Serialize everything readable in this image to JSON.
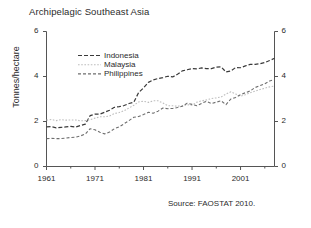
{
  "chart_data": {
    "type": "line",
    "title": "Archipelagic Southeast Asia",
    "xlabel": "",
    "ylabel": "Tonnes/hectare",
    "ylim": [
      0,
      6
    ],
    "xlim": [
      1961,
      2008
    ],
    "yticks": [
      "0",
      "2",
      "4",
      "6"
    ],
    "ytick_values": [
      0,
      2,
      4,
      6
    ],
    "xticks": [
      "1961",
      "1971",
      "1981",
      "1991",
      "2001"
    ],
    "xtick_values": [
      1961,
      1971,
      1981,
      1991,
      2001
    ],
    "minor_xtick_values": [
      1966,
      1976,
      1986,
      1996,
      2006
    ],
    "grid": false,
    "legend_position": "upper-left-inside",
    "dual_y_axis": true,
    "right_axis_ticks": [
      "0",
      "2",
      "4",
      "6"
    ],
    "source_note": "Source: FAOSTAT 2010.",
    "x": [
      1961,
      1962,
      1963,
      1964,
      1965,
      1966,
      1967,
      1968,
      1969,
      1970,
      1971,
      1972,
      1973,
      1974,
      1975,
      1976,
      1977,
      1978,
      1979,
      1980,
      1981,
      1982,
      1983,
      1984,
      1985,
      1986,
      1987,
      1988,
      1989,
      1990,
      1991,
      1992,
      1993,
      1994,
      1995,
      1996,
      1997,
      1998,
      1999,
      2000,
      2001,
      2002,
      2003,
      2004,
      2005,
      2006,
      2007,
      2008
    ],
    "series": [
      {
        "name": "Indonesia",
        "color": "#3a3a3a",
        "dash": "4,2",
        "width": 1.2,
        "values": [
          1.76,
          1.77,
          1.72,
          1.74,
          1.76,
          1.78,
          1.75,
          1.82,
          1.88,
          2.26,
          2.33,
          2.33,
          2.41,
          2.5,
          2.63,
          2.66,
          2.71,
          2.8,
          2.86,
          3.29,
          3.49,
          3.74,
          3.85,
          3.91,
          3.95,
          4.01,
          3.98,
          4.1,
          4.25,
          4.3,
          4.35,
          4.34,
          4.38,
          4.35,
          4.35,
          4.42,
          4.43,
          4.2,
          4.25,
          4.4,
          4.39,
          4.47,
          4.54,
          4.54,
          4.57,
          4.62,
          4.71,
          4.81
        ]
      },
      {
        "name": "Malaysia",
        "color": "#bdbdbd",
        "dash": "1.6,1.6",
        "width": 1.1,
        "values": [
          2.06,
          2.09,
          2.04,
          2.08,
          2.06,
          2.07,
          2.07,
          2.03,
          2.04,
          2.08,
          2.15,
          2.21,
          2.21,
          2.25,
          2.35,
          2.4,
          2.48,
          2.6,
          2.72,
          2.87,
          2.9,
          2.85,
          2.92,
          2.92,
          2.82,
          2.7,
          2.7,
          2.68,
          2.7,
          2.75,
          2.72,
          2.86,
          2.92,
          2.96,
          3.02,
          3.05,
          3.09,
          3.22,
          3.32,
          3.22,
          3.12,
          3.19,
          3.28,
          3.35,
          3.42,
          3.48,
          3.54,
          3.58
        ]
      },
      {
        "name": "Philippines",
        "color": "#6e6e6e",
        "dash": "3,2",
        "width": 1.1,
        "values": [
          1.24,
          1.25,
          1.24,
          1.24,
          1.26,
          1.29,
          1.3,
          1.36,
          1.44,
          1.68,
          1.63,
          1.52,
          1.45,
          1.53,
          1.68,
          1.76,
          1.9,
          2.04,
          2.19,
          2.22,
          2.31,
          2.41,
          2.37,
          2.46,
          2.6,
          2.57,
          2.58,
          2.62,
          2.68,
          2.81,
          2.76,
          2.7,
          2.81,
          2.9,
          2.8,
          2.86,
          2.92,
          2.75,
          3.0,
          3.07,
          3.19,
          3.28,
          3.36,
          3.51,
          3.59,
          3.68,
          3.8,
          3.86
        ]
      }
    ]
  },
  "legend": {
    "items": [
      {
        "label": "Indonesia"
      },
      {
        "label": "Malaysia"
      },
      {
        "label": "Philippines"
      }
    ]
  }
}
